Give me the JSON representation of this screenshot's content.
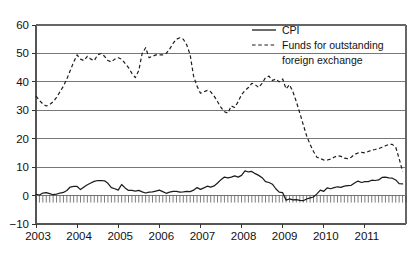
{
  "chart_data": {
    "type": "line",
    "title": "",
    "subtitle": "",
    "xlabel": "",
    "ylabel": "",
    "xlim": [
      2003.0,
      2012.0
    ],
    "ylim": [
      -10,
      60
    ],
    "yticks": [
      -10,
      0,
      10,
      20,
      30,
      40,
      50,
      60
    ],
    "ytick_labels": [
      "−10",
      "0",
      "10",
      "20",
      "30",
      "40",
      "50",
      "60"
    ],
    "xticks": [
      2003,
      2004,
      2005,
      2006,
      2007,
      2008,
      2009,
      2010,
      2011
    ],
    "xtick_labels": [
      "2003",
      "2004",
      "2005",
      "2006",
      "2007",
      "2008",
      "2009",
      "2010",
      "2011"
    ],
    "grid": true,
    "grid_axis": "y",
    "legend_position": "top-right",
    "x_minor_ticks": "monthly",
    "x_minor_tick_baseline": 0,
    "series": [
      {
        "name": "CPI",
        "style": "solid",
        "color": "#1c1c1c",
        "x": [
          2003.0,
          2003.083,
          2003.167,
          2003.25,
          2003.333,
          2003.417,
          2003.5,
          2003.583,
          2003.667,
          2003.75,
          2003.833,
          2003.917,
          2004.0,
          2004.083,
          2004.167,
          2004.25,
          2004.333,
          2004.417,
          2004.5,
          2004.583,
          2004.667,
          2004.75,
          2004.833,
          2004.917,
          2005.0,
          2005.083,
          2005.167,
          2005.25,
          2005.333,
          2005.417,
          2005.5,
          2005.583,
          2005.667,
          2005.75,
          2005.833,
          2005.917,
          2006.0,
          2006.083,
          2006.167,
          2006.25,
          2006.333,
          2006.417,
          2006.5,
          2006.583,
          2006.667,
          2006.75,
          2006.833,
          2006.917,
          2007.0,
          2007.083,
          2007.167,
          2007.25,
          2007.333,
          2007.417,
          2007.5,
          2007.583,
          2007.667,
          2007.75,
          2007.833,
          2007.917,
          2008.0,
          2008.083,
          2008.167,
          2008.25,
          2008.333,
          2008.417,
          2008.5,
          2008.583,
          2008.667,
          2008.75,
          2008.833,
          2008.917,
          2009.0,
          2009.083,
          2009.167,
          2009.25,
          2009.333,
          2009.417,
          2009.5,
          2009.583,
          2009.667,
          2009.75,
          2009.833,
          2009.917,
          2010.0,
          2010.083,
          2010.167,
          2010.25,
          2010.333,
          2010.417,
          2010.5,
          2010.583,
          2010.667,
          2010.75,
          2010.833,
          2010.917,
          2011.0,
          2011.083,
          2011.167,
          2011.25,
          2011.333,
          2011.417,
          2011.5,
          2011.583,
          2011.667,
          2011.75,
          2011.833,
          2011.917
        ],
        "values": [
          0.4,
          0.2,
          0.9,
          1.0,
          0.7,
          0.3,
          0.5,
          0.9,
          1.1,
          1.8,
          3.0,
          3.2,
          3.2,
          2.1,
          3.0,
          3.8,
          4.4,
          5.0,
          5.3,
          5.3,
          5.2,
          4.3,
          2.8,
          2.4,
          1.9,
          3.9,
          2.7,
          1.8,
          1.8,
          1.6,
          1.8,
          1.3,
          0.9,
          1.2,
          1.3,
          1.6,
          1.9,
          1.4,
          0.8,
          1.2,
          1.5,
          1.5,
          1.2,
          1.3,
          1.5,
          1.4,
          1.9,
          2.8,
          2.2,
          2.7,
          3.3,
          3.0,
          3.4,
          4.4,
          5.6,
          6.5,
          6.2,
          6.5,
          6.9,
          6.5,
          7.1,
          8.7,
          8.3,
          8.5,
          7.7,
          7.1,
          6.3,
          4.9,
          4.6,
          4.0,
          2.4,
          1.2,
          1.0,
          -1.6,
          -1.2,
          -1.5,
          -1.4,
          -1.7,
          -1.8,
          -1.2,
          -0.8,
          -0.5,
          0.6,
          1.9,
          1.5,
          2.7,
          2.4,
          2.8,
          3.1,
          2.9,
          3.3,
          3.5,
          3.6,
          4.4,
          5.1,
          4.6,
          4.9,
          4.9,
          5.4,
          5.3,
          5.5,
          6.4,
          6.5,
          6.2,
          6.1,
          5.5,
          4.2,
          4.1
        ]
      },
      {
        "name": "Funds for outstanding foreign exchange",
        "style": "dashed",
        "color": "#1c1c1c",
        "x": [
          2003.0,
          2003.083,
          2003.167,
          2003.25,
          2003.333,
          2003.417,
          2003.5,
          2003.583,
          2003.667,
          2003.75,
          2003.833,
          2003.917,
          2004.0,
          2004.083,
          2004.167,
          2004.25,
          2004.333,
          2004.417,
          2004.5,
          2004.583,
          2004.667,
          2004.75,
          2004.833,
          2004.917,
          2005.0,
          2005.083,
          2005.167,
          2005.25,
          2005.333,
          2005.417,
          2005.5,
          2005.583,
          2005.667,
          2005.75,
          2005.833,
          2005.917,
          2006.0,
          2006.083,
          2006.167,
          2006.25,
          2006.333,
          2006.417,
          2006.5,
          2006.583,
          2006.667,
          2006.75,
          2006.833,
          2006.917,
          2007.0,
          2007.083,
          2007.167,
          2007.25,
          2007.333,
          2007.417,
          2007.5,
          2007.583,
          2007.667,
          2007.75,
          2007.833,
          2007.917,
          2008.0,
          2008.083,
          2008.167,
          2008.25,
          2008.333,
          2008.417,
          2008.5,
          2008.583,
          2008.667,
          2008.75,
          2008.833,
          2008.917,
          2009.0,
          2009.083,
          2009.167,
          2009.25,
          2009.333,
          2009.417,
          2009.5,
          2009.583,
          2009.667,
          2009.75,
          2009.833,
          2009.917,
          2010.0,
          2010.083,
          2010.167,
          2010.25,
          2010.333,
          2010.417,
          2010.5,
          2010.583,
          2010.667,
          2010.75,
          2010.833,
          2010.917,
          2011.0,
          2011.083,
          2011.167,
          2011.25,
          2011.333,
          2011.417,
          2011.5,
          2011.583,
          2011.667,
          2011.75,
          2011.833,
          2011.917
        ],
        "values": [
          35.0,
          33.5,
          32.2,
          31.5,
          32.0,
          33.0,
          34.5,
          36.5,
          38.5,
          41.0,
          44.0,
          47.0,
          49.5,
          48.0,
          47.5,
          49.0,
          48.0,
          47.5,
          49.5,
          50.0,
          49.0,
          47.5,
          47.0,
          48.0,
          48.5,
          48.0,
          46.5,
          45.0,
          43.0,
          41.5,
          44.0,
          50.0,
          52.0,
          48.5,
          49.0,
          49.5,
          49.5,
          49.5,
          50.0,
          51.5,
          53.5,
          55.0,
          55.5,
          55.0,
          53.0,
          49.5,
          42.0,
          38.5,
          36.0,
          36.5,
          37.0,
          36.5,
          35.0,
          33.0,
          31.0,
          29.5,
          29.0,
          31.5,
          31.0,
          33.0,
          35.5,
          37.0,
          38.0,
          39.5,
          39.0,
          38.0,
          39.5,
          41.5,
          42.0,
          40.5,
          41.0,
          40.0,
          41.0,
          37.5,
          39.0,
          36.5,
          33.0,
          29.0,
          25.0,
          21.0,
          18.0,
          15.5,
          13.5,
          13.0,
          12.5,
          12.5,
          12.8,
          13.5,
          14.0,
          13.8,
          13.2,
          13.0,
          13.5,
          14.5,
          15.0,
          15.2,
          15.0,
          15.5,
          16.0,
          16.2,
          16.5,
          17.0,
          17.5,
          18.0,
          18.0,
          17.0,
          13.0,
          8.5
        ]
      }
    ]
  },
  "legend": {
    "entries": [
      {
        "label": "CPI",
        "style": "solid"
      },
      {
        "label": "Funds for outstanding",
        "style": "dashed"
      },
      {
        "label": "foreign exchange",
        "style": "none"
      }
    ]
  }
}
